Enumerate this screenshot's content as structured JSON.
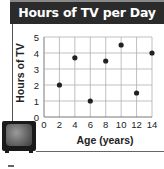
{
  "chart_data": {
    "type": "scatter",
    "title": "Hours of TV per Day",
    "xlabel": "Age (years)",
    "ylabel": "Hours of TV",
    "xlim": [
      0,
      14
    ],
    "ylim": [
      0,
      5
    ],
    "xticks": [
      0,
      2,
      4,
      6,
      8,
      10,
      12,
      14
    ],
    "yticks": [
      0,
      1,
      2,
      3,
      4,
      5
    ],
    "grid": true,
    "legend": null,
    "points": [
      {
        "x": 2,
        "y": 2
      },
      {
        "x": 4,
        "y": 3.7
      },
      {
        "x": 6,
        "y": 1
      },
      {
        "x": 8,
        "y": 3.5
      },
      {
        "x": 10,
        "y": 4.5
      },
      {
        "x": 12,
        "y": 1.5
      },
      {
        "x": 14,
        "y": 4
      }
    ],
    "x": [
      2,
      4,
      6,
      8,
      10,
      12,
      14
    ],
    "y": [
      2,
      3.7,
      1,
      3.5,
      4.5,
      1.5,
      4
    ]
  },
  "header": {
    "title": "Hours of TV per Day"
  },
  "axes": {
    "x_label": "Age (years)",
    "y_label": "Hours of TV"
  },
  "decoration": {
    "icon": "television-icon"
  },
  "colors": {
    "header_bg": "#2b2b2b",
    "header_text": "#ffffff",
    "point": "#222222",
    "grid": "#b0b0b0"
  }
}
